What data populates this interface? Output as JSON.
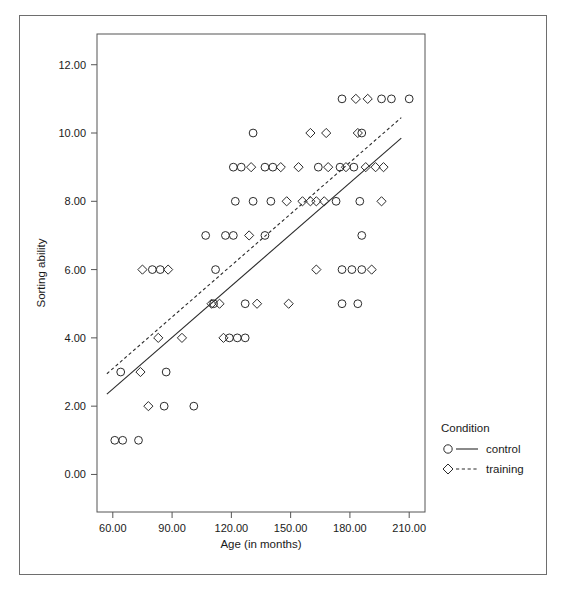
{
  "figure": {
    "background_color": "#ffffff",
    "border_color": "#6e6e6e",
    "marker_color": "#2b2b2b"
  },
  "chart_data": {
    "type": "scatter",
    "title": "",
    "xlabel": "Age (in months)",
    "ylabel": "Sorting ability",
    "xlim": [
      52,
      218
    ],
    "ylim": [
      -1.1,
      12.9
    ],
    "xticks": [
      "60.00",
      "90.00",
      "120.00",
      "150.00",
      "180.00",
      "210.00"
    ],
    "xtick_values": [
      60,
      90,
      120,
      150,
      180,
      210
    ],
    "yticks": [
      "0.00",
      "2.00",
      "4.00",
      "6.00",
      "8.00",
      "10.00",
      "12.00"
    ],
    "ytick_values": [
      0,
      2,
      4,
      6,
      8,
      10,
      12
    ],
    "grid": false,
    "legend": {
      "position": "right",
      "title": "Condition",
      "entries": [
        {
          "label": "control",
          "marker": "circle",
          "line": "solid"
        },
        {
          "label": "training",
          "marker": "diamond",
          "line": "dashed"
        }
      ]
    },
    "series": [
      {
        "name": "control",
        "marker": "circle",
        "line_style": "solid",
        "fit_line": {
          "x": [
            57,
            206
          ],
          "y": [
            2.35,
            9.85
          ]
        },
        "points": [
          [
            61,
            1
          ],
          [
            65,
            1
          ],
          [
            73,
            1
          ],
          [
            86,
            2
          ],
          [
            101,
            2
          ],
          [
            64,
            3
          ],
          [
            87,
            3
          ],
          [
            119,
            4
          ],
          [
            123,
            4
          ],
          [
            127,
            4
          ],
          [
            111,
            5
          ],
          [
            127,
            5
          ],
          [
            176,
            5
          ],
          [
            184,
            5
          ],
          [
            80,
            6
          ],
          [
            84,
            6
          ],
          [
            112,
            6
          ],
          [
            176,
            6
          ],
          [
            181,
            6
          ],
          [
            186,
            6
          ],
          [
            107,
            7
          ],
          [
            117,
            7
          ],
          [
            121,
            7
          ],
          [
            137,
            7
          ],
          [
            186,
            7
          ],
          [
            122,
            8
          ],
          [
            131,
            8
          ],
          [
            140,
            8
          ],
          [
            173,
            8
          ],
          [
            185,
            8
          ],
          [
            121,
            9
          ],
          [
            125,
            9
          ],
          [
            137,
            9
          ],
          [
            141,
            9
          ],
          [
            164,
            9
          ],
          [
            175,
            9
          ],
          [
            182,
            9
          ],
          [
            131,
            10
          ],
          [
            186,
            10
          ],
          [
            176,
            11
          ],
          [
            196,
            11
          ],
          [
            201,
            11
          ],
          [
            210,
            11
          ]
        ]
      },
      {
        "name": "training",
        "marker": "diamond",
        "line_style": "dashed",
        "fit_line": {
          "x": [
            57,
            206
          ],
          "y": [
            2.95,
            10.45
          ]
        },
        "points": [
          [
            78,
            2
          ],
          [
            74,
            3
          ],
          [
            83,
            4
          ],
          [
            95,
            4
          ],
          [
            116,
            4
          ],
          [
            110,
            5
          ],
          [
            114,
            5
          ],
          [
            133,
            5
          ],
          [
            149,
            5
          ],
          [
            75,
            6
          ],
          [
            88,
            6
          ],
          [
            163,
            6
          ],
          [
            191,
            6
          ],
          [
            129,
            7
          ],
          [
            148,
            8
          ],
          [
            156,
            8
          ],
          [
            160,
            8
          ],
          [
            163,
            8
          ],
          [
            167,
            8
          ],
          [
            196,
            8
          ],
          [
            130,
            9
          ],
          [
            145,
            9
          ],
          [
            154,
            9
          ],
          [
            169,
            9
          ],
          [
            178,
            9
          ],
          [
            188,
            9
          ],
          [
            193,
            9
          ],
          [
            197,
            9
          ],
          [
            160,
            10
          ],
          [
            168,
            10
          ],
          [
            184,
            10
          ],
          [
            183,
            11
          ],
          [
            189,
            11
          ]
        ]
      }
    ]
  }
}
